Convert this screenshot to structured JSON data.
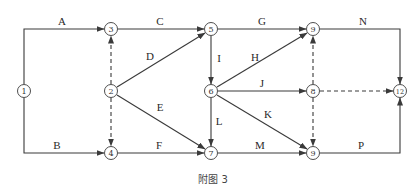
{
  "diagram": {
    "type": "activity-on-arrow network",
    "caption": "附图 3",
    "nodes": [
      {
        "id": "n1",
        "label": "1",
        "x": 24,
        "y": 91
      },
      {
        "id": "n2",
        "label": "2",
        "x": 111,
        "y": 91
      },
      {
        "id": "n3",
        "label": "3",
        "x": 111,
        "y": 29
      },
      {
        "id": "n4",
        "label": "4",
        "x": 111,
        "y": 153
      },
      {
        "id": "n5",
        "label": "5",
        "x": 211,
        "y": 29
      },
      {
        "id": "n6",
        "label": "6",
        "x": 211,
        "y": 91
      },
      {
        "id": "n7",
        "label": "7",
        "x": 211,
        "y": 153
      },
      {
        "id": "n9a",
        "label": "9",
        "x": 313,
        "y": 29
      },
      {
        "id": "n8",
        "label": "8",
        "x": 313,
        "y": 91
      },
      {
        "id": "n9b",
        "label": "9",
        "x": 313,
        "y": 153
      },
      {
        "id": "n12",
        "label": "12",
        "x": 400,
        "y": 91
      }
    ],
    "activities": [
      {
        "label": "A",
        "from": "1",
        "to": "3"
      },
      {
        "label": "B",
        "from": "1",
        "to": "4"
      },
      {
        "label": "C",
        "from": "3",
        "to": "5"
      },
      {
        "label": "D",
        "from": "2",
        "to": "5"
      },
      {
        "label": "E",
        "from": "2",
        "to": "7"
      },
      {
        "label": "F",
        "from": "4",
        "to": "7"
      },
      {
        "label": "G",
        "from": "5",
        "to": "9 (top)"
      },
      {
        "label": "H",
        "from": "6",
        "to": "9 (top)"
      },
      {
        "label": "I",
        "from": "5",
        "to": "6"
      },
      {
        "label": "J",
        "from": "6",
        "to": "8"
      },
      {
        "label": "K",
        "from": "6",
        "to": "9 (bottom)"
      },
      {
        "label": "L",
        "from": "6",
        "to": "7"
      },
      {
        "label": "M",
        "from": "7",
        "to": "9 (bottom)"
      },
      {
        "label": "N",
        "from": "9 (top)",
        "to": "12"
      },
      {
        "label": "P",
        "from": "9 (bottom)",
        "to": "12"
      }
    ],
    "dummy_activities": [
      {
        "from": "2",
        "to": "3"
      },
      {
        "from": "2",
        "to": "4"
      },
      {
        "from": "8",
        "to": "9 (top)"
      },
      {
        "from": "8",
        "to": "9 (bottom)"
      },
      {
        "from": "8",
        "to": "12"
      }
    ],
    "colors": {
      "line": "#3a3a3a",
      "background": "#ffffff"
    }
  }
}
